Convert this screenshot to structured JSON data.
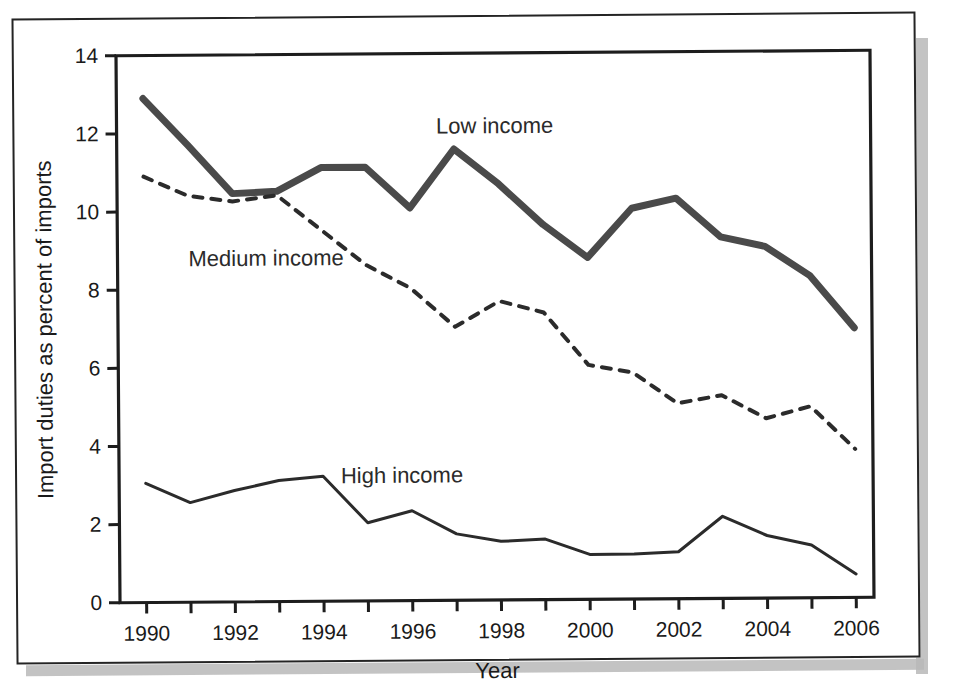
{
  "figure": {
    "background_color": "#ffffff",
    "frame_color": "#242424",
    "shadow_color": "#b9b9b9"
  },
  "chart_data": {
    "type": "line",
    "title": "",
    "subtitle": "",
    "xlabel": "Year",
    "ylabel": "Import duties as percent of imports",
    "xlim": [
      1989.4,
      2006.4
    ],
    "ylim": [
      0,
      14
    ],
    "yticks": [
      0,
      2,
      4,
      6,
      8,
      10,
      12,
      14
    ],
    "ytick_labels": [
      "0",
      "2",
      "4",
      "6",
      "8",
      "10",
      "12",
      "14"
    ],
    "xticks": [
      1990,
      1991,
      1992,
      1993,
      1994,
      1995,
      1996,
      1997,
      1998,
      1999,
      2000,
      2001,
      2002,
      2003,
      2004,
      2005,
      2006
    ],
    "xtick_labels_shown": [
      "1990",
      "1992",
      "1994",
      "1996",
      "1998",
      "2000",
      "2002",
      "2004",
      "2006"
    ],
    "x": [
      1990,
      1991,
      1992,
      1993,
      1994,
      1995,
      1996,
      1997,
      1998,
      1999,
      2000,
      2001,
      2002,
      2003,
      2004,
      2005,
      2006
    ],
    "grid": false,
    "legend_position": "inline-annotations",
    "series": [
      {
        "name": "Low income",
        "style": "solid-thick",
        "color": "#4a4a4a",
        "line_width": 7,
        "label_x": 1996.6,
        "label_y": 11.95,
        "values": [
          12.9,
          11.7,
          10.45,
          10.5,
          11.1,
          11.1,
          10.05,
          11.55,
          10.65,
          9.6,
          8.75,
          10.0,
          10.25,
          9.25,
          9.0,
          8.25,
          6.9
        ]
      },
      {
        "name": "Medium income",
        "style": "dashed",
        "color": "#2b2b2b",
        "line_width": 4,
        "label_x": 1991.0,
        "label_y": 8.6,
        "values": [
          10.9,
          10.4,
          10.25,
          10.4,
          9.5,
          8.6,
          8.0,
          7.0,
          7.65,
          7.35,
          6.0,
          5.8,
          5.0,
          5.2,
          4.6,
          4.9,
          3.8
        ]
      },
      {
        "name": "High income",
        "style": "solid-thin",
        "color": "#2b2b2b",
        "line_width": 3,
        "label_x": 1994.4,
        "label_y": 3.02,
        "values": [
          3.05,
          2.55,
          2.85,
          3.1,
          3.2,
          2.0,
          2.3,
          1.7,
          1.5,
          1.55,
          1.15,
          1.15,
          1.2,
          2.1,
          1.6,
          1.35,
          0.6
        ]
      }
    ]
  }
}
